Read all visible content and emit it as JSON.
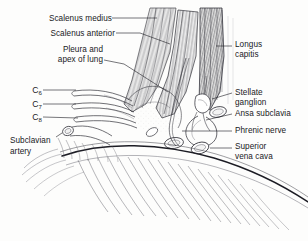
{
  "figure": {
    "style": "pen-and-ink-line-drawing",
    "width": 308,
    "height": 241,
    "background_color": "#fdfdfc",
    "ink_color": "#19191c"
  },
  "labels": {
    "left": [
      {
        "id": "scalenus-medius",
        "text": "Scalenus medius"
      },
      {
        "id": "scalenus-anterior",
        "text": "Scalenus anterior"
      },
      {
        "id": "pleura-line1",
        "text": "Pleura and"
      },
      {
        "id": "pleura-line2",
        "text": "apex of lung"
      },
      {
        "id": "c6",
        "text": "C",
        "sub": "6"
      },
      {
        "id": "c7",
        "text": "C",
        "sub": "7"
      },
      {
        "id": "c8",
        "text": "C",
        "sub": "8"
      },
      {
        "id": "subclavian-line1",
        "text": "Subclavian"
      },
      {
        "id": "subclavian-line2",
        "text": "artery"
      }
    ],
    "right": [
      {
        "id": "longus-capitis-line1",
        "text": "Longus"
      },
      {
        "id": "longus-capitis-line2",
        "text": "capitis"
      },
      {
        "id": "stellate-line1",
        "text": "Stellate"
      },
      {
        "id": "stellate-line2",
        "text": "ganglion"
      },
      {
        "id": "ansa-subclavia",
        "text": "Ansa subclavia"
      },
      {
        "id": "phrenic-nerve",
        "text": "Phrenic nerve"
      },
      {
        "id": "svc-line1",
        "text": "Superior"
      },
      {
        "id": "svc-line2",
        "text": "vena cava"
      }
    ]
  }
}
